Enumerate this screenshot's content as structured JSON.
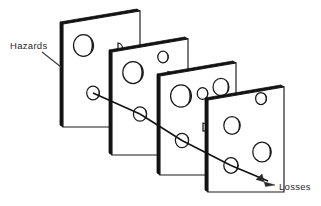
{
  "diagram": {
    "type": "layered-defence-barriers",
    "background_color": "#ffffff",
    "line_color": "#111111",
    "label_color": "#2b2b2b",
    "labels": {
      "hazards": "Hazards",
      "losses": "Losses"
    },
    "layers": [
      {
        "index": 1,
        "name": "barrier-slice-1",
        "holes": 3
      },
      {
        "index": 2,
        "name": "barrier-slice-2",
        "holes": 3
      },
      {
        "index": 3,
        "name": "barrier-slice-3",
        "holes": 4
      },
      {
        "index": 4,
        "name": "barrier-slice-4",
        "holes": 4
      }
    ],
    "trajectory": {
      "name": "accident-trajectory",
      "from": "Hazards",
      "to": "Losses",
      "arrowhead": "filled-triangle"
    }
  }
}
